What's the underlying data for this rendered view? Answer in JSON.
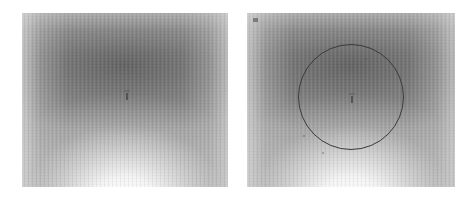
{
  "figure": {
    "background_color": "#ffffff",
    "width": 476,
    "height": 199,
    "panel_count": 2
  },
  "panels": [
    {
      "id": "left-panel",
      "label": "left image panel",
      "x": 22,
      "y": 13,
      "width": 206,
      "height": 174,
      "has_annotation_circle": false,
      "centre_mark": {
        "x": 104,
        "y": 80
      },
      "corner_marks": []
    },
    {
      "id": "right-panel",
      "label": "right image panel",
      "x": 247,
      "y": 13,
      "width": 208,
      "height": 174,
      "has_annotation_circle": true,
      "centre_mark": {
        "x": 104,
        "y": 83
      },
      "annotation": {
        "shape": "circle",
        "center_x": 104,
        "center_y": 84,
        "radius": 53,
        "stroke_color": "#3a3a3a",
        "stroke_width": 1
      },
      "corner_marks": [
        {
          "position": "top-left",
          "text": ""
        },
        {
          "position": "top-right",
          "text": ""
        }
      ]
    }
  ],
  "appearance": {
    "image_type": "grayscale",
    "gradient_description": "dark band upper-centre, bright glow lower-centre",
    "texture": "fine vertical column striping",
    "dark_tone": "#606060",
    "mid_tone": "#9a9a9a",
    "bright_tone": "#ffffff",
    "annotation_color": "#3a3a3a"
  }
}
